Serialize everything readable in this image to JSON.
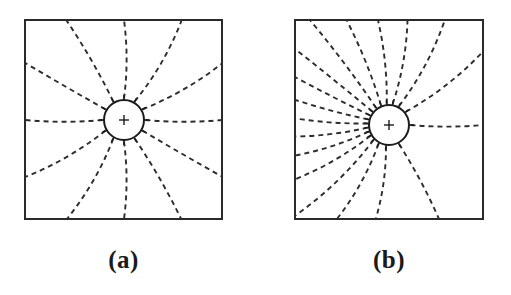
{
  "figure": {
    "background_color": "#ffffff",
    "ink_color": "#2d2d2d",
    "frame_color": "#2a2a2a",
    "width": 511,
    "height": 295
  },
  "chart_data": {
    "type": "diagram",
    "panels": [
      {
        "label": "(a)",
        "caption": "(a)",
        "distribution": "uniform",
        "ray_count": 12,
        "angular_spacing_deg": 30,
        "frame": {
          "x": 25,
          "y": 20,
          "width": 197,
          "height": 199
        },
        "source": {
          "cx": 124,
          "cy": 120,
          "r": 20
        },
        "tick_count": 12,
        "tick_length": 5,
        "ray_curvature": 0.16,
        "ray_angles_deg": [
          0,
          30,
          60,
          90,
          120,
          150,
          180,
          210,
          240,
          270,
          300,
          330
        ]
      },
      {
        "label": "(b)",
        "caption": "(b)",
        "distribution": "non-uniform",
        "ray_count": 18,
        "frame": {
          "x": 295,
          "y": 20,
          "width": 188,
          "height": 199
        },
        "source": {
          "cx": 389,
          "cy": 125,
          "r": 20
        },
        "tick_count": 18,
        "tick_length": 5,
        "ray_curvature": 0.16,
        "ray_angles_deg": [
          0,
          38,
          62,
          80,
          96,
          112,
          127,
          141,
          153,
          165,
          176,
          187,
          198,
          210,
          224,
          241,
          262,
          298
        ],
        "rays_exiting_left_edge": 6,
        "rays_exiting_right_edge": 3
      }
    ],
    "dash_pattern": {
      "dash": 5,
      "gap": 4
    },
    "grid": false,
    "legend": null,
    "xlabel": "",
    "ylabel": ""
  }
}
